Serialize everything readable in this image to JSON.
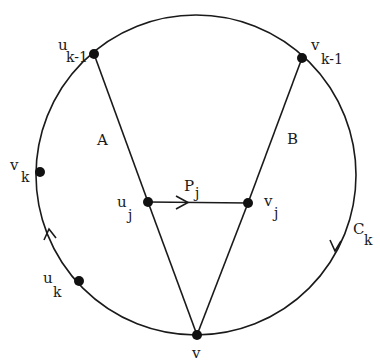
{
  "figure": {
    "type": "graph-diagram",
    "circle": {
      "cx": 196,
      "cy": 175,
      "r": 160,
      "label": "C",
      "label_sub": "k"
    },
    "nodes": [
      {
        "id": "u_k-1",
        "base": "u",
        "sub": "k-1",
        "x": 94,
        "y": 54
      },
      {
        "id": "v_k-1",
        "base": "v",
        "sub": "k-1",
        "x": 302,
        "y": 58
      },
      {
        "id": "v_k",
        "base": "v",
        "sub": "k",
        "x": 40,
        "y": 172
      },
      {
        "id": "u_k",
        "base": "u",
        "sub": "k",
        "x": 79,
        "y": 281
      },
      {
        "id": "u_j",
        "base": "u",
        "sub": "j",
        "x": 148,
        "y": 202
      },
      {
        "id": "v_j",
        "base": "v",
        "sub": "j",
        "x": 248,
        "y": 203
      },
      {
        "id": "v",
        "base": "v",
        "sub": "",
        "x": 197,
        "y": 335
      }
    ],
    "edges": [
      {
        "from": "u_k-1",
        "to": "u_j",
        "label": "A"
      },
      {
        "from": "u_j",
        "to": "v"
      },
      {
        "from": "v_k-1",
        "to": "v_j",
        "label": "B"
      },
      {
        "from": "v_j",
        "to": "v"
      },
      {
        "from": "u_j",
        "to": "v_j",
        "label": "P",
        "label_sub": "j",
        "directed": true
      }
    ],
    "labels": {
      "A": "A",
      "B": "B",
      "P": "P",
      "P_sub": "j",
      "C": "C",
      "C_sub": "k",
      "u_k1": "u",
      "u_k1_sub": "k-1",
      "v_k1": "v",
      "v_k1_sub": "k-1",
      "v_k": "v",
      "v_k_sub": "k",
      "u_k": "u",
      "u_k_sub": "k",
      "u_j": "u",
      "u_j_sub": "j",
      "v_j": "v",
      "v_j_sub": "j",
      "v": "v"
    }
  }
}
